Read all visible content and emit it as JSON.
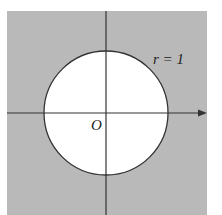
{
  "figure": {
    "type": "unit-circle-region",
    "labels": {
      "radius": "r = 1",
      "origin": "O"
    },
    "colors": {
      "background": "#ffffff",
      "shaded_region": "#b9b9b9",
      "disk": "#ffffff",
      "axes": "#333333",
      "circle": "#333333",
      "text": "#222222"
    },
    "geometry": {
      "center": [
        106,
        113
      ],
      "radius": 62,
      "shaded_box": [
        7,
        11,
        200,
        204
      ]
    },
    "axes": {
      "horizontal_arrow": true,
      "vertical_arrow": false
    }
  }
}
